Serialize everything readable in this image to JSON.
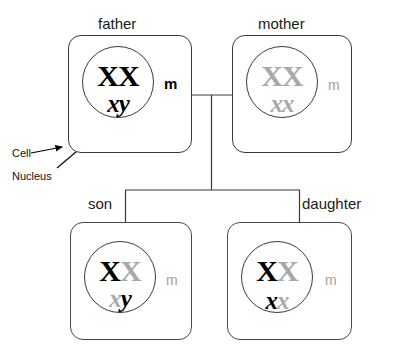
{
  "diagram": {
    "title_father": "father",
    "title_mother": "mother",
    "title_son": "son",
    "title_daughter": "daughter",
    "annotation_cell": "Cell",
    "annotation_nucleus": "Nucleus",
    "colors": {
      "paternal": "#000000",
      "maternal": "#a8a8a8",
      "outline": "#3a3a3a",
      "background": "#ffffff"
    }
  },
  "individuals": {
    "father": {
      "label": "father",
      "upper_left": "X",
      "upper_right": "X",
      "lower_left": "x",
      "lower_right": "y",
      "upper_left_origin": "paternal",
      "upper_right_origin": "paternal",
      "lower_left_origin": "paternal",
      "lower_right_origin": "paternal",
      "marker": "m",
      "marker_origin": "paternal"
    },
    "mother": {
      "label": "mother",
      "upper_left": "X",
      "upper_right": "X",
      "lower_left": "x",
      "lower_right": "x",
      "upper_left_origin": "maternal",
      "upper_right_origin": "maternal",
      "lower_left_origin": "maternal",
      "lower_right_origin": "maternal",
      "marker": "m",
      "marker_origin": "maternal"
    },
    "son": {
      "label": "son",
      "upper_left": "X",
      "upper_right": "X",
      "lower_left": "x",
      "lower_right": "y",
      "upper_left_origin": "paternal",
      "upper_right_origin": "maternal",
      "lower_left_origin": "maternal",
      "lower_right_origin": "paternal",
      "marker": "m",
      "marker_origin": "maternal"
    },
    "daughter": {
      "label": "daughter",
      "upper_left": "X",
      "upper_right": "X",
      "lower_left": "x",
      "lower_right": "x",
      "upper_left_origin": "paternal",
      "upper_right_origin": "maternal",
      "lower_left_origin": "paternal",
      "lower_right_origin": "maternal",
      "marker": "m",
      "marker_origin": "maternal"
    }
  }
}
